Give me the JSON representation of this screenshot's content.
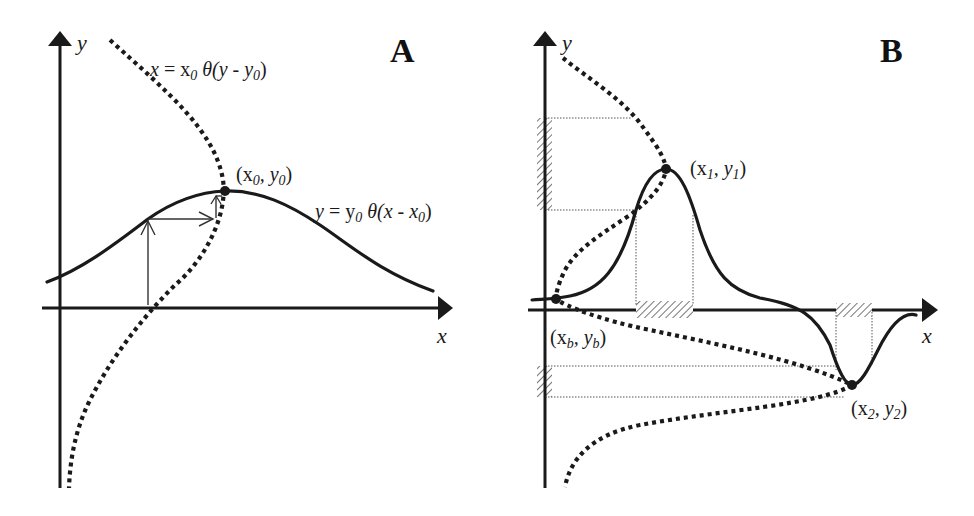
{
  "panels": {
    "A": {
      "letter": "A",
      "y_axis_label": "y",
      "x_axis_label": "x",
      "inverse_curve_label": "x = x₀ θ(y - y₀)",
      "forward_curve_label": "y = y₀ θ(x - x₀)",
      "point_label": "(x₀ , y₀)"
    },
    "B": {
      "letter": "B",
      "y_axis_label": "y",
      "x_axis_label": "x",
      "point1_label": "(x₁ , y₁)",
      "point2_label": "(x₂ , y₂)",
      "pointb_label": "(x_b , y_b)",
      "pointb_main": "(x",
      "pointb_sub1": "b",
      "pointb_mid": ", y",
      "pointb_sub2": "b",
      "pointb_end": ")"
    }
  },
  "labels": {
    "A_eq1_x": "x",
    "A_eq1_eq": " = x",
    "A_eq1_sub": "0",
    "A_eq1_theta": " θ(y - y",
    "A_eq1_sub2": "0",
    "A_eq1_end": ")",
    "A_eq2_y": "y",
    "A_eq2_eq": " = y",
    "A_eq2_sub": "0",
    "A_eq2_theta": " θ(x - x",
    "A_eq2_sub2": "0",
    "A_eq2_end": ")",
    "A_pt_open": "(x",
    "A_pt_sub": "0",
    "A_pt_mid": ", y",
    "A_pt_sub2": "0",
    "A_pt_end": ")",
    "B_p1_open": "(x",
    "B_p1_sub": "1",
    "B_p1_mid": ", y",
    "B_p1_sub2": "1",
    "B_p1_end": ")",
    "B_p2_open": "(x",
    "B_p2_sub": "2",
    "B_p2_mid": ", y",
    "B_p2_sub2": "2",
    "B_p2_end": ")"
  },
  "colors": {
    "ink": "#1a1a1a",
    "background": "#ffffff",
    "hatch": "#555555"
  }
}
